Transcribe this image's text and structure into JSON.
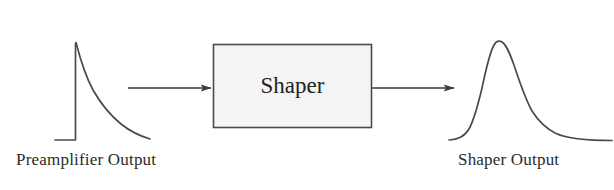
{
  "figure": {
    "background_color": "#ffffff",
    "width": 614,
    "height": 190
  },
  "blocks": [
    {
      "id": "shaper",
      "label": "Shaper",
      "fill_color": "#f4f4f4",
      "stroke_color": "#4a4a4a",
      "x": 213,
      "y": 44,
      "width": 159,
      "height": 84
    }
  ],
  "labels": {
    "preamplifier_output": "Preamplifier Output",
    "shaper_output": "Shaper Output"
  },
  "arrows": [
    {
      "id": "preamp-to-shaper",
      "from_x": 128,
      "to_x": 213,
      "y": 88,
      "color": "#3a3a3a"
    },
    {
      "id": "shaper-to-output",
      "from_x": 372,
      "to_x": 456,
      "y": 88,
      "color": "#3a3a3a"
    }
  ],
  "waveforms": [
    {
      "id": "preamplifier-pulse",
      "name": "preamplifier-output-waveform",
      "shape": "step-rise-exponential-decay",
      "stroke_color": "#4a4a4a",
      "baseline_y": 140,
      "peak_x": 76,
      "peak_y": 42,
      "start_x": 55,
      "end_x": 150
    },
    {
      "id": "shaper-pulse",
      "name": "shaper-output-waveform",
      "shape": "asymmetric-gaussian",
      "stroke_color": "#4a4a4a",
      "baseline_y": 140,
      "peak_x": 498,
      "peak_y": 41,
      "start_x": 449,
      "end_x": 612
    }
  ],
  "colors": {
    "ink": "#4a4a4a",
    "text": "#2b2b2b",
    "box_fill": "#f4f4f4",
    "background": "#ffffff"
  }
}
